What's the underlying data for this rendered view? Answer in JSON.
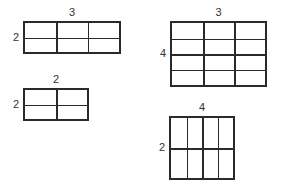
{
  "title": "",
  "grids": [
    {
      "id": "a",
      "cols": 3,
      "rows": 2,
      "top_label": "3",
      "side_label": "2",
      "x": 23,
      "y": 21,
      "w": 98,
      "h": 33
    },
    {
      "id": "b",
      "cols": 2,
      "rows": 2,
      "top_label": "2",
      "side_label": "2",
      "x": 23,
      "y": 88,
      "w": 66,
      "h": 33
    },
    {
      "id": "c",
      "cols": 3,
      "rows": 4,
      "top_label": "3",
      "side_label": "4",
      "x": 170,
      "y": 21,
      "w": 97,
      "h": 66
    },
    {
      "id": "d",
      "cols": 4,
      "rows": 2,
      "top_label": "4",
      "side_label": "2",
      "x": 169,
      "y": 116,
      "w": 66,
      "h": 64
    }
  ]
}
